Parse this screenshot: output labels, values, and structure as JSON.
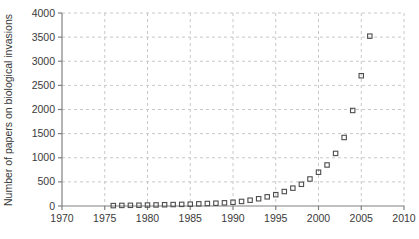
{
  "chart_data": {
    "type": "scatter",
    "title": "",
    "xlabel": "",
    "ylabel": "Number of papers on biological invasions",
    "xlim": [
      1970,
      2010
    ],
    "ylim": [
      0,
      4000
    ],
    "xticks": [
      1970,
      1975,
      1980,
      1985,
      1990,
      1995,
      2000,
      2005,
      2010
    ],
    "xtick_labels": [
      "1970",
      "1975",
      "1980",
      "1985",
      "1990",
      "1995",
      "2000",
      "2005",
      "2010"
    ],
    "yticks": [
      0,
      500,
      1000,
      1500,
      2000,
      2500,
      3000,
      3500,
      4000
    ],
    "ytick_labels": [
      "0",
      "500",
      "1000",
      "1500",
      "2000",
      "2500",
      "3000",
      "3500",
      "4000"
    ],
    "grid": true,
    "grid_style": "dashed",
    "legend": null,
    "marker": "open-square",
    "marker_color": "#4d4d4d",
    "series": [
      {
        "name": "Papers on biological invasions",
        "x": [
          1976,
          1977,
          1978,
          1979,
          1980,
          1981,
          1982,
          1983,
          1984,
          1985,
          1986,
          1987,
          1988,
          1989,
          1990,
          1991,
          1992,
          1993,
          1994,
          1995,
          1996,
          1997,
          1998,
          1999,
          2000,
          2001,
          2002,
          2003,
          2004,
          2005,
          2006
        ],
        "y": [
          8,
          12,
          14,
          16,
          20,
          22,
          26,
          30,
          34,
          38,
          45,
          52,
          58,
          66,
          78,
          95,
          120,
          150,
          190,
          235,
          300,
          370,
          450,
          560,
          700,
          850,
          1090,
          1420,
          1980,
          2700,
          3520
        ]
      }
    ]
  },
  "colors": {
    "axis": "#808080",
    "grid": "#c8c8c8",
    "marker": "#4d4d4d",
    "text": "#3a3a3a",
    "background": "#ffffff"
  },
  "geometry": {
    "plot_left": 62,
    "plot_right": 404,
    "plot_top": 13,
    "plot_bottom": 206
  }
}
